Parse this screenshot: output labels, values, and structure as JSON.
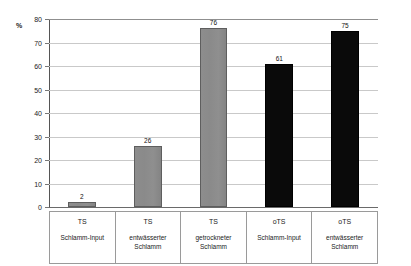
{
  "chart_data": {
    "type": "bar",
    "title": "",
    "xlabel": "",
    "ylabel": "%",
    "unit_label": "%",
    "ylim": [
      0,
      80
    ],
    "ytick_labels": [
      "80",
      "70",
      "60",
      "50",
      "40",
      "30",
      "20",
      "10",
      "0"
    ],
    "ytick_values": [
      80,
      70,
      60,
      50,
      40,
      30,
      20,
      10,
      0
    ],
    "grid": true,
    "legend": "none",
    "categories": [
      "TS Schlamm-Input",
      "TS entwässerter Schlamm",
      "TS getrockneter Schlamm",
      "oTS Schlamm-Input",
      "oTS entwässerter Schlamm"
    ],
    "values": [
      2,
      26,
      76,
      61,
      75
    ],
    "bar_colors": [
      "#8a8a8a",
      "#8a8a8a",
      "#8a8a8a",
      "#0a0a0a",
      "#0a0a0a"
    ],
    "bars": [
      {
        "parameter": "TS",
        "sample": "Schlamm-Input",
        "value": 2,
        "label": "2",
        "color": "gray"
      },
      {
        "parameter": "TS",
        "sample": "entwässerter Schlamm",
        "value": 26,
        "label": "26",
        "color": "gray"
      },
      {
        "parameter": "TS",
        "sample": "getrockneter Schlamm",
        "value": 76,
        "label": "76",
        "color": "gray"
      },
      {
        "parameter": "oTS",
        "sample": "Schlamm-Input",
        "value": 61,
        "label": "61",
        "color": "black"
      },
      {
        "parameter": "oTS",
        "sample": "entwässerter Schlamm",
        "value": 75,
        "label": "75",
        "color": "black"
      }
    ]
  },
  "colors": {
    "gray_bar": "#8a8a8a",
    "black_bar": "#0a0a0a",
    "gridline": "#c9c9c9",
    "axis": "#555555",
    "table_border": "#9a9a9a"
  }
}
